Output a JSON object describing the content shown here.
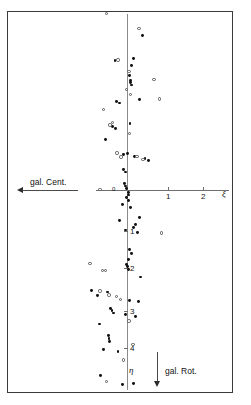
{
  "figure": {
    "background_color": "#ffffff",
    "frame_color": "#3a3a3a",
    "point_filled_color": "#111111",
    "point_open_color": "#555555"
  },
  "annotations": {
    "gal_center_label": "gal. Cent.",
    "gal_rotation_label": "gal. Rot.",
    "x_axis_symbol": "ξ",
    "y_axis_symbol": "η",
    "origin_label": "0"
  },
  "chart_data": {
    "type": "scatter",
    "title": "",
    "subtitle": "",
    "xlabel": "ξ",
    "ylabel": "η",
    "xlim": [
      -3.2,
      2.8
    ],
    "ylim": [
      -5.3,
      4.7
    ],
    "grid": false,
    "legend_position": "none",
    "x_ticks": [
      1,
      2
    ],
    "x_tick_labels": [
      "1",
      "2"
    ],
    "y_ticks": [
      -1,
      -2,
      -3,
      -4
    ],
    "y_tick_labels": [
      "1",
      "2",
      "3",
      "4"
    ],
    "axis_note": "y tick labels are printed as positive digits 1..4 increasing downward (galactic rotation direction)",
    "series": [
      {
        "name": "filled-circles",
        "marker": "filled circle",
        "color": "#111111",
        "points": [
          [
            0.42,
            3.95
          ],
          [
            0.18,
            3.35
          ],
          [
            -0.32,
            3.3
          ],
          [
            0.11,
            3.18
          ],
          [
            0.06,
            2.93
          ],
          [
            0.09,
            2.8
          ],
          [
            0.1,
            2.74
          ],
          [
            0.12,
            2.68
          ],
          [
            0.34,
            2.3
          ],
          [
            -0.28,
            2.26
          ],
          [
            -0.21,
            2.22
          ],
          [
            0.08,
            1.7
          ],
          [
            -0.38,
            1.62
          ],
          [
            -0.3,
            1.57
          ],
          [
            -0.57,
            1.28
          ],
          [
            0.02,
            0.94
          ],
          [
            -0.1,
            0.9
          ],
          [
            0.21,
            0.86
          ],
          [
            0.48,
            0.8
          ],
          [
            0.57,
            0.76
          ],
          [
            -0.09,
            0.52
          ],
          [
            -0.05,
            0.46
          ],
          [
            -0.06,
            0.16
          ],
          [
            -0.04,
            0.1
          ],
          [
            -0.02,
            0.04
          ],
          [
            0.03,
            -0.06
          ],
          [
            0.05,
            -0.13
          ],
          [
            -0.01,
            -0.2
          ],
          [
            0.04,
            -0.27
          ],
          [
            -0.12,
            -0.38
          ],
          [
            0.09,
            -0.45
          ],
          [
            0.33,
            -0.7
          ],
          [
            -0.2,
            -0.77
          ],
          [
            0.22,
            -0.88
          ],
          [
            0.18,
            -0.96
          ],
          [
            -0.05,
            -1.02
          ],
          [
            0.28,
            -1.08
          ],
          [
            0.07,
            -1.52
          ],
          [
            0.12,
            -1.62
          ],
          [
            0.05,
            -1.78
          ],
          [
            -0.02,
            -1.9
          ],
          [
            0.01,
            -1.96
          ],
          [
            0.03,
            -2.02
          ],
          [
            0.35,
            -2.22
          ],
          [
            -0.95,
            -2.56
          ],
          [
            -0.52,
            -2.6
          ],
          [
            -0.78,
            -2.7
          ],
          [
            0.07,
            -2.82
          ],
          [
            0.3,
            -2.84
          ],
          [
            -0.44,
            -3.02
          ],
          [
            -0.4,
            -3.08
          ],
          [
            -0.35,
            -3.14
          ],
          [
            -0.04,
            -3.18
          ],
          [
            0.23,
            -3.22
          ],
          [
            -0.74,
            -3.42
          ],
          [
            -0.5,
            -3.72
          ],
          [
            -0.48,
            -3.78
          ],
          [
            -0.46,
            -3.86
          ],
          [
            -0.62,
            -4.06
          ],
          [
            -0.24,
            -4.12
          ],
          [
            -0.7,
            -4.74
          ],
          [
            -0.11,
            -4.96
          ],
          [
            0.18,
            -4.94
          ]
        ]
      },
      {
        "name": "open-circles",
        "marker": "open circle",
        "color": "#555555",
        "points": [
          [
            -0.55,
            4.5
          ],
          [
            0.32,
            4.12
          ],
          [
            -0.24,
            3.32
          ],
          [
            0.05,
            3.02
          ],
          [
            0.72,
            2.82
          ],
          [
            -0.02,
            2.56
          ],
          [
            0.1,
            2.44
          ],
          [
            0.86,
            2.32
          ],
          [
            -0.62,
            2.06
          ],
          [
            -0.38,
            1.72
          ],
          [
            -0.45,
            1.66
          ],
          [
            0.06,
            1.44
          ],
          [
            -0.27,
            0.94
          ],
          [
            -0.16,
            0.84
          ],
          [
            0.27,
            0.86
          ],
          [
            0.43,
            0.78
          ],
          [
            -0.72,
            0.02
          ],
          [
            0.92,
            -1.1
          ],
          [
            -0.99,
            -1.88
          ],
          [
            -0.66,
            -2.06
          ],
          [
            -0.58,
            -2.06
          ],
          [
            -0.48,
            -2.68
          ],
          [
            -0.28,
            -2.72
          ],
          [
            -0.18,
            -2.8
          ],
          [
            -0.72,
            -2.58
          ],
          [
            0.05,
            -3.34
          ],
          [
            0.16,
            -3.94
          ],
          [
            -0.1,
            -4.34
          ],
          [
            -0.55,
            -4.88
          ]
        ]
      }
    ]
  }
}
